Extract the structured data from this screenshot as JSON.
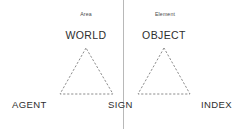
{
  "diagram": {
    "background_color": "#ffffff",
    "divider": {
      "name": "vertical-divider",
      "color": "#b8b8b8",
      "x": 123
    },
    "left_panel": {
      "caption": "Area",
      "top_term": "WORLD",
      "bottom_term": "AGENT",
      "triangle": {
        "apex": [
          86,
          48
        ],
        "base_left": [
          60,
          94
        ],
        "base_right": [
          113,
          94
        ],
        "stroke_color": "#6e6e6e",
        "style": "dashed"
      }
    },
    "right_panel": {
      "caption": "Element",
      "top_term": "OBJECT",
      "bottom_term": "INDEX",
      "triangle": {
        "apex": [
          164,
          48
        ],
        "base_left": [
          138,
          94
        ],
        "base_right": [
          190,
          94
        ],
        "stroke_color": "#6e6e6e",
        "style": "dashed"
      }
    },
    "center_term": "SIGN"
  }
}
